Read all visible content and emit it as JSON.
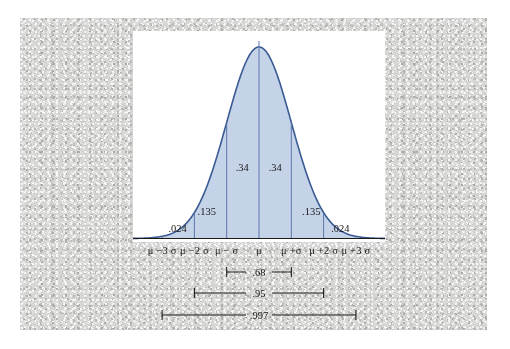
{
  "figure": {
    "kind": "normal-distribution-bell-curve",
    "colors": {
      "curve_stroke": "#3a5a93",
      "curve_fill": "#c5d3e8",
      "divider_line": "#5a77ad",
      "axis_line": "#1c1a17",
      "bracket_line": "#1c1a17",
      "text": "#1b1916",
      "panel_background": "#ffffff",
      "page_background": "#dededc"
    }
  },
  "chart_data": {
    "type": "area",
    "title": "",
    "subtitle": "",
    "xlabel": "",
    "ylabel": "",
    "distribution": "normal",
    "mean_symbol": "μ",
    "sigma_symbol": "σ",
    "xlim": [
      -3.9,
      3.9
    ],
    "ylim": [
      0,
      1
    ],
    "grid": false,
    "legend": null,
    "x_tick_values": [
      -3,
      -2,
      -1,
      0,
      1,
      2,
      3
    ],
    "x_tick_labels": [
      "μ −3 σ",
      "μ −2 σ",
      "μ − σ",
      "μ",
      "μ +σ",
      "μ +2 σ",
      "μ +3 σ"
    ],
    "region_labels": [
      {
        "name": "left-outer-tail",
        "text": ".024",
        "x": -2.52,
        "y": 0.055
      },
      {
        "name": "left-mid-band",
        "text": ".135",
        "x": -1.62,
        "y": 0.145
      },
      {
        "name": "left-inner-band",
        "text": ".34",
        "x": -0.52,
        "y": 0.375
      },
      {
        "name": "right-inner-band",
        "text": ".34",
        "x": 0.5,
        "y": 0.375
      },
      {
        "name": "right-mid-band",
        "text": ".135",
        "x": 1.62,
        "y": 0.145
      },
      {
        "name": "right-outer-tail",
        "text": ".024",
        "x": 2.52,
        "y": 0.055
      }
    ],
    "interval_brackets": [
      {
        "name": "one-sigma-interval",
        "text": ".68",
        "from": -1,
        "to": 1
      },
      {
        "name": "two-sigma-interval",
        "text": ".95",
        "from": -2,
        "to": 2
      },
      {
        "name": "three-sigma-interval",
        "text": ".997",
        "from": -3,
        "to": 3
      }
    ],
    "series": [
      {
        "name": "normal-density",
        "values": [
          0.0001,
          0.0004,
          0.0011,
          0.0028,
          0.0065,
          0.0139,
          0.0278,
          0.0513,
          0.0879,
          0.1394,
          0.2051,
          0.278,
          0.3476,
          0.4,
          0.424,
          0.413,
          0.369,
          0.3012,
          0.2251,
          0.1537,
          0.0957,
          0.054,
          0.0278,
          0.013,
          0.0056,
          0.0022,
          0.0008,
          0.0003
        ]
      }
    ]
  }
}
